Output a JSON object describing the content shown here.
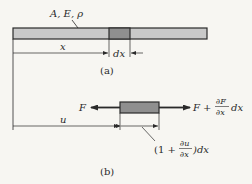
{
  "figure_a": {
    "bar_label": "A, E, ρ",
    "position_label": "x",
    "element_length_label": "dx",
    "caption": "(a)"
  },
  "figure_b": {
    "left_force_label": "F",
    "right_force_label": {
      "base": "F +",
      "numerator": "∂F",
      "denominator": "∂x",
      "suffix": "dx"
    },
    "displacement_label": "u",
    "deformed_length_label": {
      "open": "(1 +",
      "numerator": "∂u",
      "denominator": "∂x",
      "close": ")dx"
    },
    "caption": "(b)"
  },
  "colors": {
    "background": "#f7f6f2",
    "bar_fill": "#c9c9c9",
    "element_fill": "#8f8f8f",
    "line": "#2a2a2a"
  }
}
